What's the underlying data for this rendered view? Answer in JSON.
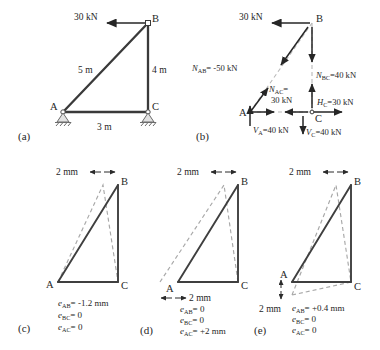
{
  "figure": {
    "background": "#ffffff",
    "line_color": "#3a3a3a",
    "dashed_color": "#b0b0b0",
    "text_color": "#262626"
  },
  "panels": [
    {
      "id": "a",
      "label": "(a)",
      "nodes": {
        "A": "A",
        "B": "B",
        "C": "C"
      },
      "load_label": "30 kN",
      "dimensions": [
        {
          "name": "AB",
          "text": "5 m"
        },
        {
          "name": "BC",
          "text": "4 m"
        },
        {
          "name": "AC",
          "text": "3 m"
        }
      ],
      "supports": [
        "pin-A",
        "pin-C"
      ]
    },
    {
      "id": "b",
      "label": "(b)",
      "nodes": {
        "A": "A",
        "B": "B",
        "C": "C"
      },
      "load_label": "30 kN",
      "forces": [
        {
          "name": "N_AB",
          "symbol": "N",
          "sub": "AB",
          "value": "= -50 kN",
          "text": "N_AB= -50 kN"
        },
        {
          "name": "N_BC",
          "symbol": "N",
          "sub": "BC",
          "value": "=40 kN",
          "text": "N_BC=40 kN"
        },
        {
          "name": "N_AC",
          "symbol": "N",
          "sub": "AC",
          "value": "=",
          "text": "N_AC="
        },
        {
          "name": "N_AC_value",
          "text": "30 kN"
        },
        {
          "name": "H_C",
          "symbol": "H",
          "sub": "C",
          "value": "=30 kN",
          "text": "H_C=30 kN"
        },
        {
          "name": "V_A",
          "symbol": "V",
          "sub": "A",
          "value": "=40 kN",
          "text": "V_A=40 kN"
        },
        {
          "name": "V_C",
          "symbol": "V",
          "sub": "C",
          "value": "=40 kN",
          "text": "V_C=40 kN"
        }
      ]
    },
    {
      "id": "c",
      "label": "(c)",
      "nodes": {
        "A": "A",
        "B": "B",
        "C": "C"
      },
      "offset_label": "2 mm",
      "offset_position": "top",
      "equations": [
        {
          "symbol": "e",
          "sub": "AB",
          "value": "= -1.2 mm"
        },
        {
          "symbol": "e",
          "sub": "BC",
          "value": "= 0"
        },
        {
          "symbol": "e",
          "sub": "AC",
          "value": "= 0"
        }
      ]
    },
    {
      "id": "d",
      "label": "(d)",
      "nodes": {
        "A": "A",
        "B": "B",
        "C": "C"
      },
      "offset_label": "2 mm",
      "offset_label_2": "2 mm",
      "offset_position": "top-and-left",
      "equations": [
        {
          "symbol": "e",
          "sub": "AB",
          "value": "= 0"
        },
        {
          "symbol": "e",
          "sub": "BC",
          "value": "= 0"
        },
        {
          "symbol": "e",
          "sub": "AC",
          "value": "= +2 mm"
        }
      ]
    },
    {
      "id": "e",
      "label": "(e)",
      "nodes": {
        "A": "A",
        "B": "B",
        "C": "C"
      },
      "offset_label": "2 mm",
      "offset_label_2": "2 mm",
      "offset_position": "top-and-bottom-left",
      "equations": [
        {
          "symbol": "e",
          "sub": "AB",
          "value": "= +0.4 mm"
        },
        {
          "symbol": "e",
          "sub": "BC",
          "value": "= 0"
        },
        {
          "symbol": "e",
          "sub": "AC",
          "value": "= 0"
        }
      ]
    }
  ]
}
